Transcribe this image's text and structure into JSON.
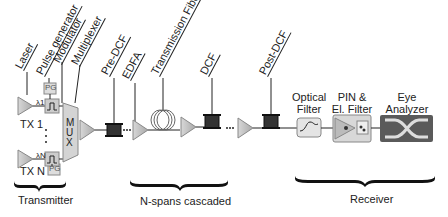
{
  "component_labels": {
    "laser": "Laser",
    "pulse_generator": "Pulse generator",
    "modulator": "Modulator",
    "multiplexer": "Multiplexer",
    "pre_dcf": "Pre-DCF",
    "edfa": "EDFA",
    "transmission_fiber": "Transmission Fiber",
    "dcf": "DCF",
    "post_dcf": "Post-DCF"
  },
  "blocks": {
    "pg": "PG",
    "mux": "MUX",
    "tx1": "TX 1",
    "txn": "TX N",
    "lambda1": "λ1",
    "lambdan": "λN",
    "optical_filter": "Optical\nFilter",
    "optical_filter_l1": "Optical",
    "optical_filter_l2": "Filter",
    "pin_l1": "PIN &",
    "pin_l2": "El. Filter",
    "eye_l1": "Eye",
    "eye_l2": "Analyzer"
  },
  "sections": {
    "transmitter": "Transmitter",
    "spans": "N-spans cascaded",
    "receiver": "Receiver"
  },
  "colors": {
    "block_fill": "#c8c8c8",
    "amp_fill": "#b8b8b8",
    "eye_fill": "#5a5a5a",
    "line": "#222222"
  }
}
